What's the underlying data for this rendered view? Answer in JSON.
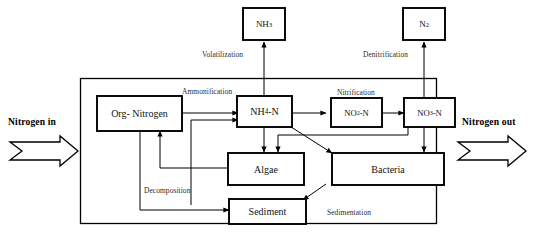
{
  "diagram": {
    "colors": {
      "stroke": "#000000",
      "box_fill": "#ffffff",
      "background": "#ffffff",
      "label_text": "#2a2a2a"
    },
    "io": {
      "inlet_label": "Nitrogen in",
      "outlet_label": "Nitrogen out"
    },
    "external_nodes": [
      {
        "id": "nh3",
        "label_main": "NH",
        "label_sub": "3",
        "name": "ammonia"
      },
      {
        "id": "n2",
        "label_main": "N",
        "label_sub": "2",
        "name": "dinitrogen"
      }
    ],
    "nodes": [
      {
        "id": "org_nitrogen",
        "label": "Org- Nitrogen"
      },
      {
        "id": "nh4_n",
        "label_pre": "NH",
        "label_sub": "4",
        "label_post": "-N"
      },
      {
        "id": "no2_n",
        "label_pre": "NO",
        "label_sub": "2",
        "label_post": "-N"
      },
      {
        "id": "no3_n",
        "label_pre": "NO",
        "label_sub": "3",
        "label_post": "-N"
      },
      {
        "id": "algae",
        "label": "Algae"
      },
      {
        "id": "bacteria",
        "label": "Bacteria"
      },
      {
        "id": "sediment",
        "label": "Sediment"
      }
    ],
    "process_labels": [
      {
        "id": "volatilization",
        "label": "Volatilization"
      },
      {
        "id": "denitrification",
        "label": "Denitrification"
      },
      {
        "id": "ammonification",
        "label": "Ammonification"
      },
      {
        "id": "nitrification",
        "label": "Nitrification"
      },
      {
        "id": "decomposition",
        "label": "Decomposition"
      },
      {
        "id": "sedimentation",
        "label": "Sedimentation"
      }
    ]
  }
}
